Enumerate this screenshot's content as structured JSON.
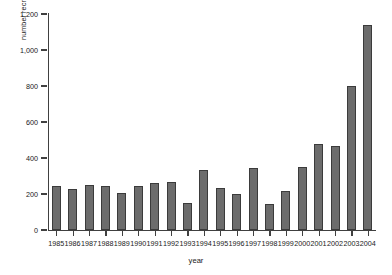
{
  "chart_data": {
    "type": "bar",
    "title": "",
    "subtitle": "",
    "xlabel": "year",
    "ylabel": "number recruited",
    "grid": false,
    "legend": null,
    "xlim_categories": [
      "1985",
      "2004"
    ],
    "ylim": [
      0,
      1200
    ],
    "ytick_labels": [
      "0",
      "200",
      "400",
      "600",
      "800",
      "1,000",
      "1,200"
    ],
    "ytick_values": [
      0,
      200,
      400,
      600,
      800,
      1000,
      1200
    ],
    "categories": [
      "1985",
      "1986",
      "1987",
      "1988",
      "1989",
      "1990",
      "1991",
      "1992",
      "1993",
      "1994",
      "1995",
      "1996",
      "1997",
      "1998",
      "1999",
      "2000",
      "2001",
      "2002",
      "2003",
      "2004"
    ],
    "values": [
      243,
      228,
      250,
      243,
      208,
      243,
      261,
      268,
      152,
      333,
      232,
      198,
      347,
      143,
      217,
      348,
      480,
      464,
      798,
      1140
    ],
    "bar_color": "#6c6c6c",
    "bar_edge_color": "#3b3b3b",
    "axis_color": "#404040",
    "text_color": "#1a1a1a",
    "background_color": "#ffffff"
  }
}
